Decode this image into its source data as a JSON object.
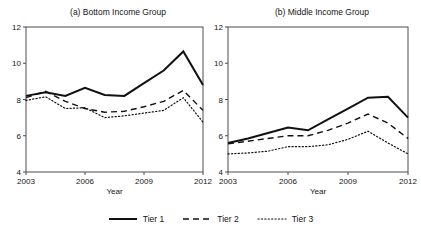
{
  "figure": {
    "background": "#ffffff",
    "line_color": "#111111",
    "axis_color": "#4d4d4d"
  },
  "legend": {
    "position": "bottom-center",
    "entries": [
      {
        "label": "Tier 1",
        "style": "solid",
        "swatch_name": "legend-swatch-tier1"
      },
      {
        "label": "Tier 2",
        "style": "dashed",
        "swatch_name": "legend-swatch-tier2"
      },
      {
        "label": "Tier 3",
        "style": "dotted",
        "swatch_name": "legend-swatch-tier3"
      }
    ]
  },
  "panels": {
    "a": {
      "title": "(a) Bottom Income Group",
      "xlabel": "Year",
      "xticks": [
        "2003",
        "2006",
        "2009",
        "2012"
      ],
      "yticks": [
        "4",
        "6",
        "8",
        "10",
        "12"
      ]
    },
    "b": {
      "title": "(b) Middle Income Group",
      "xlabel": "Year",
      "xticks": [
        "2003",
        "2006",
        "2009",
        "2012"
      ],
      "yticks": [
        "4",
        "6",
        "8",
        "10",
        "12"
      ]
    }
  },
  "chart_data": [
    {
      "type": "line",
      "panel": "a",
      "title": "(a) Bottom Income Group",
      "xlabel": "Year",
      "ylabel": "",
      "x": [
        2003,
        2004,
        2005,
        2006,
        2007,
        2008,
        2009,
        2010,
        2011,
        2012
      ],
      "xlim": [
        2003,
        2012
      ],
      "ylim": [
        4,
        12
      ],
      "xticks": [
        2003,
        2006,
        2009,
        2012
      ],
      "yticks": [
        4,
        6,
        8,
        10,
        12
      ],
      "grid": false,
      "legend": "bottom",
      "series": [
        {
          "name": "Tier 1",
          "style": "solid",
          "values": [
            8.2,
            8.4,
            8.2,
            8.65,
            8.25,
            8.2,
            8.9,
            9.6,
            10.65,
            8.8
          ]
        },
        {
          "name": "Tier 2",
          "style": "dashed",
          "values": [
            8.1,
            8.45,
            7.9,
            7.5,
            7.3,
            7.35,
            7.6,
            7.9,
            8.5,
            7.4
          ]
        },
        {
          "name": "Tier 3",
          "style": "dotted",
          "values": [
            7.95,
            8.15,
            7.5,
            7.55,
            7.0,
            7.1,
            7.25,
            7.4,
            8.1,
            6.75
          ]
        }
      ]
    },
    {
      "type": "line",
      "panel": "b",
      "title": "(b) Middle Income Group",
      "xlabel": "Year",
      "ylabel": "",
      "x": [
        2003,
        2004,
        2005,
        2006,
        2007,
        2008,
        2009,
        2010,
        2011,
        2012
      ],
      "xlim": [
        2003,
        2012
      ],
      "ylim": [
        4,
        12
      ],
      "xticks": [
        2003,
        2006,
        2009,
        2012
      ],
      "yticks": [
        4,
        6,
        8,
        10,
        12
      ],
      "grid": false,
      "legend": "bottom",
      "series": [
        {
          "name": "Tier 1",
          "style": "solid",
          "values": [
            5.6,
            5.85,
            6.15,
            6.45,
            6.3,
            6.9,
            7.5,
            8.1,
            8.15,
            7.0
          ]
        },
        {
          "name": "Tier 2",
          "style": "dashed",
          "values": [
            5.55,
            5.7,
            5.85,
            6.0,
            6.0,
            6.3,
            6.7,
            7.2,
            6.7,
            5.85
          ]
        },
        {
          "name": "Tier 3",
          "style": "dotted",
          "values": [
            5.0,
            5.05,
            5.15,
            5.4,
            5.4,
            5.5,
            5.8,
            6.25,
            5.6,
            5.0
          ]
        }
      ]
    }
  ]
}
